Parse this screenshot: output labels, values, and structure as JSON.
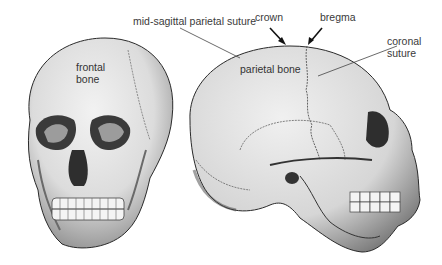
{
  "diagram": {
    "views": [
      {
        "name": "frontal view",
        "labels": [
          "frontal bone"
        ]
      },
      {
        "name": "lateral view",
        "labels": [
          "parietal bone",
          "crown",
          "bregma",
          "coronal suture",
          "mid-sagittal parietal suture"
        ]
      }
    ],
    "labels": {
      "mid_sagittal": "mid-sagittal parietal suture",
      "crown": "crown",
      "bregma": "bregma",
      "coronal_line1": "coronal",
      "coronal_line2": "suture",
      "parietal": "parietal bone",
      "frontal_line1": "frontal",
      "frontal_line2": "bone"
    },
    "colors": {
      "bone_fill": "#e4e4e4",
      "bone_shadow": "#9a9a9a",
      "outline": "#2a2a2a",
      "label_text": "#3a3a3a"
    }
  }
}
